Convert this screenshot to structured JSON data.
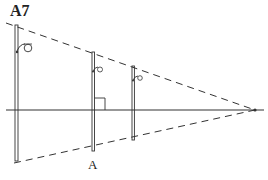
{
  "figure": {
    "title": "A7",
    "point_label": "A"
  },
  "diagram": {
    "type": "perspective-construction",
    "elements": {
      "horizon_line": {
        "x1": 6,
        "x2": 264,
        "y": 110
      },
      "vanishing_point": {
        "x": 255,
        "y": 110
      },
      "top_converging_line": {
        "style": "dashed",
        "from": [
          6,
          23
        ],
        "to": [
          255,
          110
        ]
      },
      "bottom_converging_line": {
        "style": "dashed",
        "from": [
          14,
          163
        ],
        "to": [
          255,
          110
        ]
      },
      "lamp_posts": [
        {
          "name": "near",
          "x": 16,
          "top": 25,
          "bottom": 161
        },
        {
          "name": "middle",
          "x": 93,
          "top": 52,
          "bottom": 151,
          "label": "A"
        },
        {
          "name": "far",
          "x": 133,
          "top": 66,
          "bottom": 140
        }
      ],
      "right_angle_marker": {
        "x": 93,
        "y": 110,
        "size": 12
      }
    },
    "colors": {
      "ink": "#333333",
      "background": "#ffffff"
    }
  }
}
